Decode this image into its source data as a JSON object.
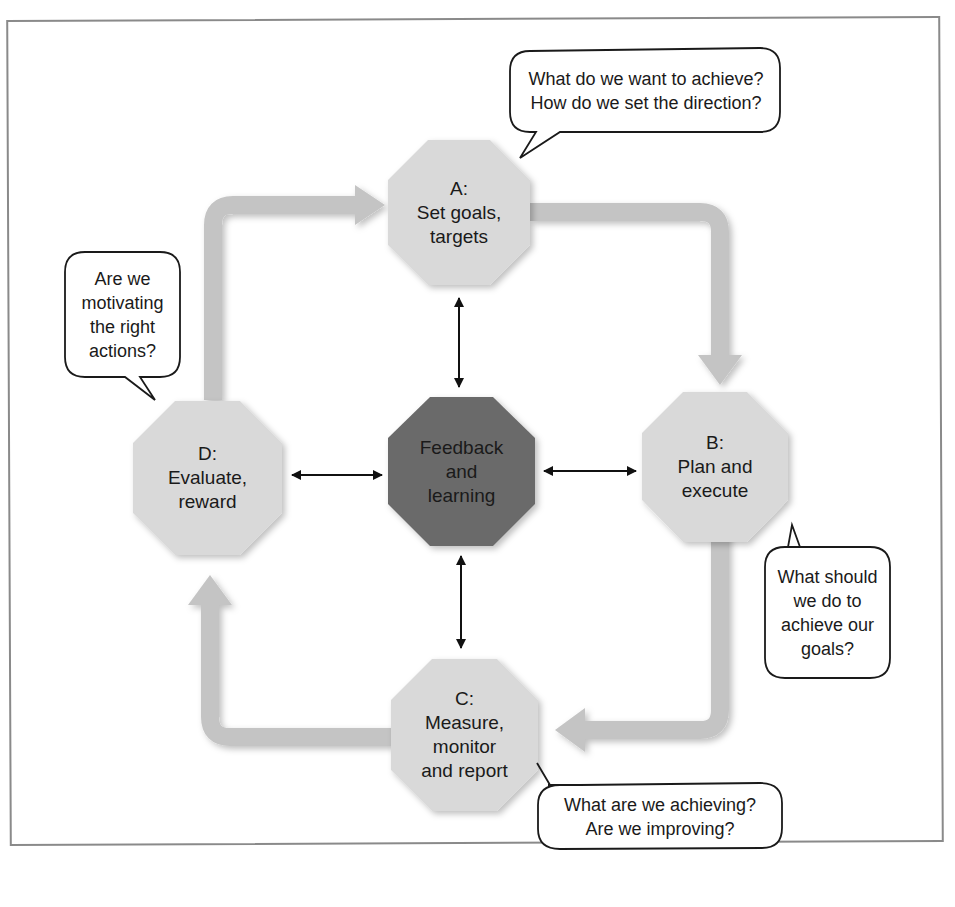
{
  "colors": {
    "node_fill": "#d9d9d9",
    "center_fill": "#6b6b6b",
    "flow_arrow": "#c4c4c4",
    "connector": "#111111",
    "frame": "#8a8a8a",
    "bubble_border": "#1a1a1a"
  },
  "nodes": {
    "a": {
      "label": "A:\nSet goals,\ntargets"
    },
    "b": {
      "label": "B:\nPlan and\nexecute"
    },
    "c": {
      "label": "C:\nMeasure,\nmonitor\nand report"
    },
    "d": {
      "label": "D:\nEvaluate,\nreward"
    },
    "center": {
      "label": "Feedback\nand\nlearning"
    }
  },
  "bubbles": {
    "a": {
      "text": "What do we want to achieve?\nHow do we set the direction?"
    },
    "b": {
      "text": "What should\nwe do to\nachieve our\ngoals?"
    },
    "c": {
      "text": "What are we achieving?\nAre we improving?"
    },
    "d": {
      "text": "Are we\nmotivating\nthe right\nactions?"
    }
  }
}
